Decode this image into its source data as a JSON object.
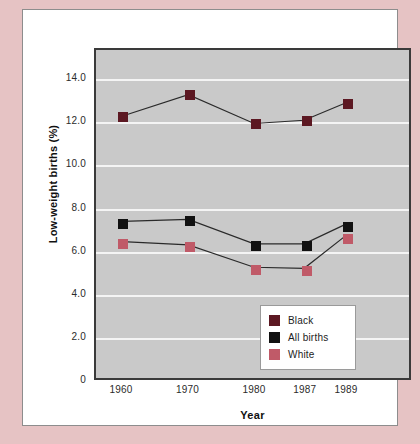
{
  "chart_data": {
    "type": "line",
    "title": "",
    "xlabel": "Year",
    "ylabel": "Low-weight births (%)",
    "categories": [
      "1960",
      "1970",
      "1980",
      "1987",
      "1989"
    ],
    "ylim": [
      0,
      15.4
    ],
    "yticks": [
      "0",
      "2.0",
      "4.0",
      "6.0",
      "8.0",
      "10.0",
      "12.0",
      "14.0"
    ],
    "ytick_values": [
      0,
      2.0,
      4.0,
      6.0,
      8.0,
      10.0,
      12.0,
      14.0
    ],
    "grid": "horizontal",
    "legend_position": "bottom-right",
    "plot_background": "#c9c9c9",
    "gridline_color": "#f4f4f4",
    "series": [
      {
        "name": "Black",
        "color": "#5c1822",
        "marker": "square",
        "values": [
          12.3,
          13.3,
          11.95,
          12.1,
          12.9
        ]
      },
      {
        "name": "All births",
        "color": "#111111",
        "marker": "square",
        "values": [
          7.35,
          7.45,
          6.3,
          6.3,
          7.2
        ]
      },
      {
        "name": "White",
        "color": "#c05a68",
        "marker": "square",
        "values": [
          6.4,
          6.25,
          5.2,
          5.15,
          6.65
        ]
      }
    ]
  },
  "legend": {
    "items": [
      {
        "label": "Black",
        "color": "#5c1822"
      },
      {
        "label": "All births",
        "color": "#111111"
      },
      {
        "label": "White",
        "color": "#c05a68"
      }
    ]
  },
  "page": {
    "mat_color": "#e6c3c4",
    "card_color": "#ffffff"
  }
}
